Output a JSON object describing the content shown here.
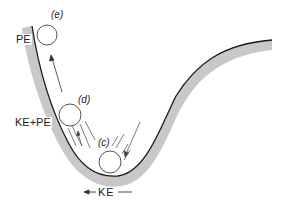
{
  "diagram": {
    "colors": {
      "track_line": "#1a1a1a",
      "track_band": "#c8c8c8",
      "ball_stroke": "#555555",
      "text": "#222222"
    },
    "balls": [
      {
        "id": "e",
        "label": "(e)",
        "cx": 47,
        "cy": 35,
        "r": 10
      },
      {
        "id": "d",
        "label": "(d)",
        "cx": 70,
        "cy": 115,
        "r": 11
      },
      {
        "id": "c",
        "label": "(c)",
        "cx": 110,
        "cy": 162,
        "r": 11
      }
    ],
    "energy_labels": {
      "top": "PE",
      "middle": "KE+PE",
      "bottom": "KE"
    }
  }
}
